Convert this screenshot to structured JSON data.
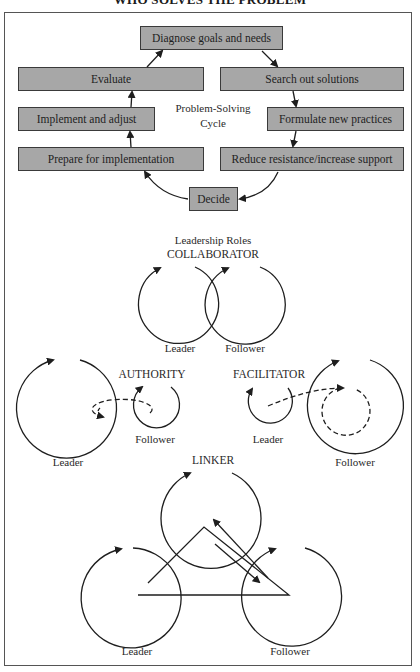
{
  "title": "WHO SOLVES THE PROBLEM",
  "cycle": {
    "center_label_line1": "Problem-Solving",
    "center_label_line2": "Cycle",
    "steps": [
      {
        "id": "diagnose",
        "label": "Diagnose goals and needs"
      },
      {
        "id": "search",
        "label": "Search out solutions"
      },
      {
        "id": "formulate",
        "label": "Formulate new practices"
      },
      {
        "id": "reduce",
        "label": "Reduce resistance/increase support"
      },
      {
        "id": "decide",
        "label": "Decide"
      },
      {
        "id": "prepare",
        "label": "Prepare for implementation"
      },
      {
        "id": "implement",
        "label": "Implement and adjust"
      },
      {
        "id": "evaluate",
        "label": "Evaluate"
      }
    ],
    "box_color": "#a7a7a7"
  },
  "roles": {
    "heading": "Leadership Roles",
    "collaborator": {
      "title": "COLLABORATOR",
      "leader": "Leader",
      "follower": "Follower"
    },
    "authority": {
      "title": "AUTHORITY",
      "leader": "Leader",
      "follower": "Follower"
    },
    "facilitator": {
      "title": "FACILITATOR",
      "leader": "Leader",
      "follower": "Follower"
    },
    "linker": {
      "title": "LINKER",
      "leader": "Leader",
      "follower": "Follower"
    }
  }
}
